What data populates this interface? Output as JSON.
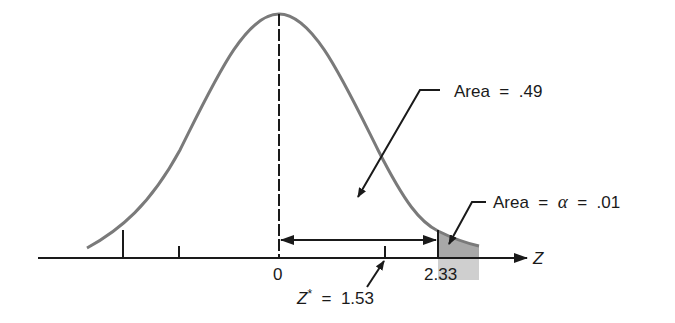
{
  "diagram": {
    "type": "normal-distribution-hypothesis-test",
    "axis_label": "Z",
    "tick_labels": {
      "zero": "0",
      "critical": "2.33"
    },
    "annotations": {
      "area_body": "Area  =  .49",
      "area_tail_prefix": "Area  =  ",
      "area_tail_alpha": "α",
      "area_tail_suffix": "  =  .01",
      "z_star_var": "Z",
      "z_star_sup": "*",
      "z_star_value": "  =  1.53"
    },
    "values": {
      "critical_z": 2.33,
      "z_star": 1.53,
      "alpha": 0.01,
      "area_between": 0.49
    },
    "colors": {
      "curve": "#7a7a7a",
      "tail_fill": "#a8a8a8",
      "tail_fill_below": "#cfcfcf",
      "ink": "#1a1a1a"
    }
  }
}
